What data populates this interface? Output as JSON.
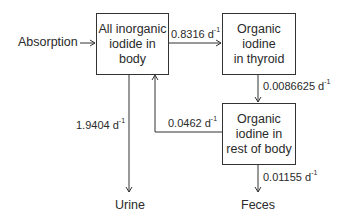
{
  "diagram": {
    "compartments": [
      {
        "id": "inorganic",
        "label": "All inorganic\niodide in\nbody"
      },
      {
        "id": "thyroid",
        "label": "Organic\niodine\nin thyroid"
      },
      {
        "id": "rest",
        "label": "Organic\niodine in\nrest of body"
      }
    ],
    "external": {
      "absorption": "Absorption",
      "urine": "Urine",
      "feces": "Feces"
    },
    "rates": {
      "inorganic_to_thyroid": {
        "value": "0.8316 d",
        "unit_exp": "-1"
      },
      "thyroid_to_rest": {
        "value": "0.0086625  d",
        "unit_exp": "-1"
      },
      "rest_to_inorganic": {
        "value": "0.0462 d",
        "unit_exp": "-1"
      },
      "inorganic_to_urine": {
        "value": "1.9404 d",
        "unit_exp": "-1"
      },
      "rest_to_feces": {
        "value": "0.01155 d",
        "unit_exp": "-1"
      }
    },
    "line_color": "#333333"
  }
}
